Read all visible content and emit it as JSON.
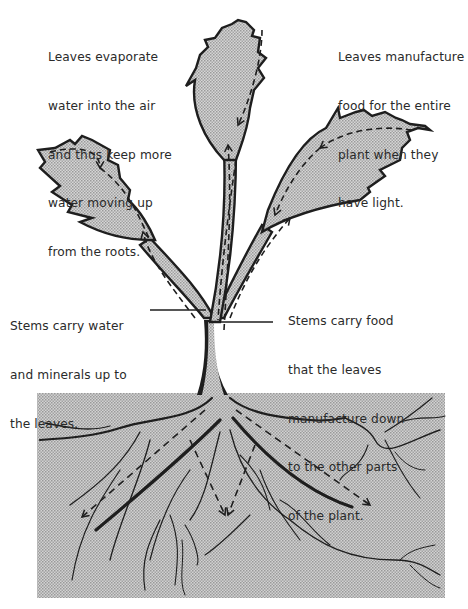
{
  "diagram": {
    "colors": {
      "background": "#ffffff",
      "shading": "#c8c8c8",
      "soil": "#c4c4c4",
      "outline": "#1e1e1e",
      "text": "#2a2a2a"
    },
    "labels": {
      "leaves_evaporate": {
        "lines": [
          "Leaves evaporate",
          "water into the air",
          "and thus keep more",
          "water moving up",
          "from the roots."
        ]
      },
      "leaves_manufacture": {
        "lines": [
          "Leaves manufacture",
          "food for the entire",
          "plant when they",
          "have light."
        ]
      },
      "stems_water": {
        "lines": [
          "Stems carry water",
          "and minerals up to",
          "the leaves."
        ]
      },
      "stems_food": {
        "lines": [
          "Stems carry food",
          "that the leaves",
          "manufacture down",
          "to the other parts",
          "of the plant."
        ]
      }
    },
    "parts": [
      {
        "name": "top-leaf",
        "arrow": "dashed, downward"
      },
      {
        "name": "left-leaf",
        "arrow": "dashed, clockwise to stem"
      },
      {
        "name": "right-leaf",
        "arrow": "dashed, toward stem"
      },
      {
        "name": "stem",
        "arrow": "dashed, up and down channels"
      },
      {
        "name": "soil",
        "arrow": "dashed, into roots"
      },
      {
        "name": "roots"
      }
    ]
  }
}
